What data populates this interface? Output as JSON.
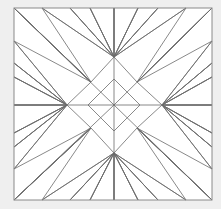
{
  "figure": {
    "type": "line-art-geometric",
    "canvas": {
      "width": 221,
      "height": 209
    },
    "colors": {
      "page_background": "#efefef",
      "panel_background": "#ffffff",
      "stroke": "#6b6b6b",
      "border_stroke": "#8a8a8a"
    },
    "stroke_width": 0.8,
    "frame": {
      "x0": 14,
      "y0": 8,
      "x1": 212,
      "y1": 200
    },
    "center": {
      "x": 114,
      "y": 105
    },
    "inner_diamond": {
      "name": "central-diamond",
      "points": [
        [
          114,
          79
        ],
        [
          140,
          105
        ],
        [
          114,
          131
        ],
        [
          88,
          105
        ]
      ]
    },
    "star": {
      "name": "eight-pointed-star",
      "tips": [
        {
          "label": "north",
          "x": 114,
          "y": 57
        },
        {
          "label": "east",
          "x": 162,
          "y": 105
        },
        {
          "label": "south",
          "x": 114,
          "y": 153
        },
        {
          "label": "west",
          "x": 67,
          "y": 105
        }
      ],
      "notches": [
        {
          "label": "ne",
          "x": 137,
          "y": 82
        },
        {
          "label": "se",
          "x": 137,
          "y": 128
        },
        {
          "label": "sw",
          "x": 91,
          "y": 128
        },
        {
          "label": "nw",
          "x": 91,
          "y": 82
        }
      ]
    },
    "edge_vertices": {
      "top": [
        14,
        42,
        70,
        90,
        114,
        138,
        158,
        186,
        212
      ],
      "bottom": [
        14,
        42,
        70,
        90,
        114,
        138,
        158,
        186,
        212
      ],
      "left": [
        8,
        41,
        63,
        77,
        105,
        133,
        147,
        169,
        200
      ],
      "right": [
        8,
        41,
        63,
        77,
        105,
        133,
        147,
        169,
        200
      ]
    },
    "axes": {
      "horizontal": {
        "y": 105,
        "x_from": 14,
        "x_to": 212
      },
      "vertical": {
        "x": 114,
        "y_from": 8,
        "y_to": 200
      }
    },
    "ray_count": 32,
    "symmetry": "8-fold dihedral (mirrored about both axes and diagonals)"
  }
}
